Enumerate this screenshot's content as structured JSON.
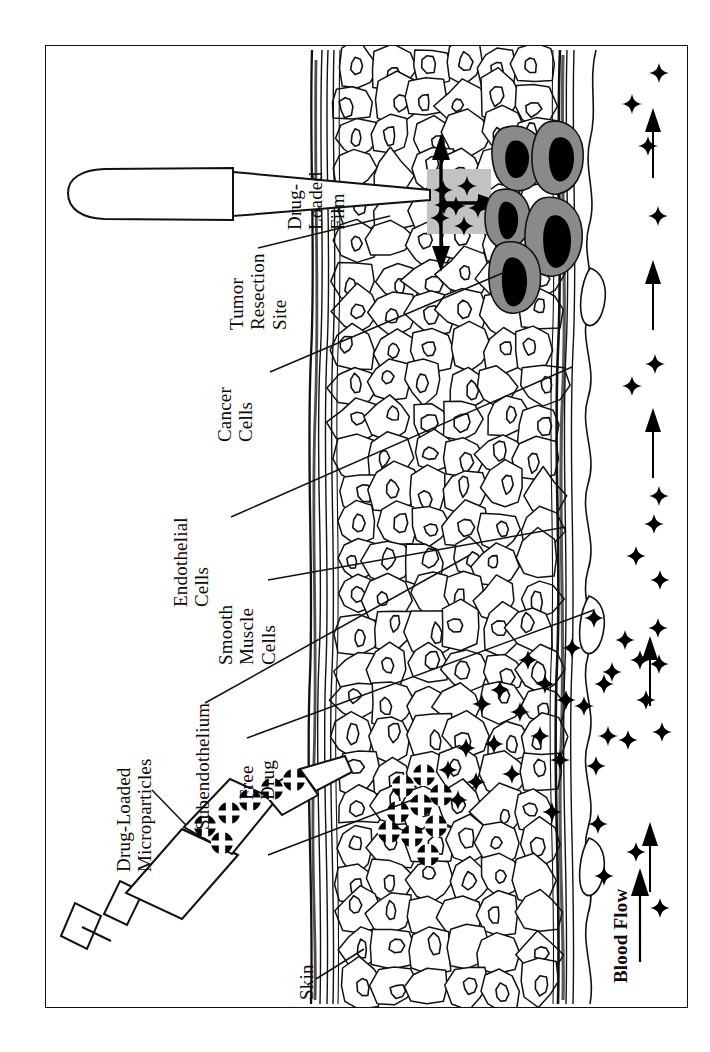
{
  "figure": {
    "kind": "anatomical-cross-section-diagram",
    "orientation": "rotated-90-ccw",
    "border_color": "#111111",
    "background": "#ffffff"
  },
  "labels": {
    "drug_loaded_film": {
      "lines": [
        "Drug-",
        "Loaded",
        "Film"
      ]
    },
    "tumor_resection_site": {
      "lines": [
        "Tumor",
        "Resection",
        "Site"
      ]
    },
    "cancer_cells": {
      "lines": [
        "Cancer",
        "Cells"
      ]
    },
    "endothelial_cells": {
      "lines": [
        "Endothelial",
        "Cells"
      ]
    },
    "smooth_muscle_cells": {
      "lines": [
        "Smooth",
        "Muscle",
        "Cells"
      ]
    },
    "subendothelium": {
      "lines": [
        "Subendothelium"
      ]
    },
    "free_drug": {
      "lines": [
        "Free",
        "Drug"
      ]
    },
    "drug_loaded_microparticles": {
      "lines": [
        "Drug-Loaded",
        "Microparticles"
      ]
    },
    "skin": {
      "lines": [
        "Skin"
      ]
    },
    "blood_flow": {
      "lines": [
        "Blood Flow"
      ]
    }
  },
  "legend_symbols": {
    "free_drug_symbol": "four-pointed-star",
    "microparticle_symbol": "black-disc-with-white-cross",
    "blood_flow_symbol": "up-arrow",
    "cancer_cell_fill": "#8a8a8a",
    "cancer_nucleus_fill": "#000000",
    "film_fill": "#bdbdbd"
  },
  "instruments": {
    "applicator": {
      "name": "scalpel-applicator",
      "note": "elongated blade delivering drug-loaded film"
    },
    "syringe": {
      "name": "syringe",
      "note": "barrel with plunger loaded with microparticles"
    }
  },
  "counts": {
    "cancer_cells": 5,
    "blood_flow_arrows": 5,
    "film_drug_stars": 7,
    "syringe_microparticles": 6
  }
}
